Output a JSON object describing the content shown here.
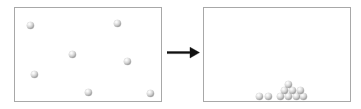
{
  "figure": {
    "title": "",
    "caption": "",
    "background_color": "#ffffff",
    "width": 361,
    "height": 109
  },
  "panels": {
    "left": {
      "name": "before-panel",
      "label": "",
      "border_color": "#a8a8a8",
      "fill_color": "#ffffff",
      "x": 14,
      "y": 7,
      "width": 148,
      "height": 95,
      "particle_count": 7,
      "state_description": "particles dispersed"
    },
    "right": {
      "name": "after-panel",
      "label": "",
      "border_color": "#a8a8a8",
      "fill_color": "#ffffff",
      "x": 203,
      "y": 7,
      "width": 148,
      "height": 95,
      "particle_count": 10,
      "state_description": "particles settled at bottom"
    }
  },
  "arrow": {
    "label": "",
    "direction": "right",
    "color": "#111111",
    "x": 167,
    "y": 44,
    "width": 33,
    "height": 17
  },
  "particle_style": {
    "diameter": 7,
    "highlight_color": "#ffffff",
    "base_color": "#d2d2d2",
    "shadow_color": "#8e8e8e"
  },
  "chart_data": {
    "type": "scatter",
    "title": "",
    "subtitle": "",
    "xlabel": "",
    "ylabel": "",
    "grid": false,
    "legend": null,
    "annotations": [
      "arrow-right"
    ],
    "panels": [
      {
        "name": "left",
        "xlim": [
          14,
          162
        ],
        "ylim": [
          7,
          102
        ],
        "points": [
          {
            "x": 30,
            "y": 25,
            "r": 3.5
          },
          {
            "x": 117,
            "y": 23,
            "r": 3.5
          },
          {
            "x": 72,
            "y": 54,
            "r": 3.5
          },
          {
            "x": 127,
            "y": 61,
            "r": 3.5
          },
          {
            "x": 34,
            "y": 74,
            "r": 3.5
          },
          {
            "x": 88,
            "y": 92,
            "r": 3.5
          },
          {
            "x": 150,
            "y": 93,
            "r": 3.5
          }
        ]
      },
      {
        "name": "right",
        "xlim": [
          203,
          351
        ],
        "ylim": [
          7,
          102
        ],
        "points": [
          {
            "x": 259,
            "y": 96,
            "r": 3.5
          },
          {
            "x": 268,
            "y": 96,
            "r": 3.5
          },
          {
            "x": 280,
            "y": 96,
            "r": 3.5
          },
          {
            "x": 288,
            "y": 96,
            "r": 3.5
          },
          {
            "x": 296,
            "y": 96,
            "r": 3.5
          },
          {
            "x": 303,
            "y": 96,
            "r": 3.5
          },
          {
            "x": 284,
            "y": 90,
            "r": 3.5
          },
          {
            "x": 292,
            "y": 90,
            "r": 3.5
          },
          {
            "x": 300,
            "y": 90,
            "r": 3.5
          },
          {
            "x": 288,
            "y": 84,
            "r": 3.5
          }
        ]
      }
    ]
  }
}
